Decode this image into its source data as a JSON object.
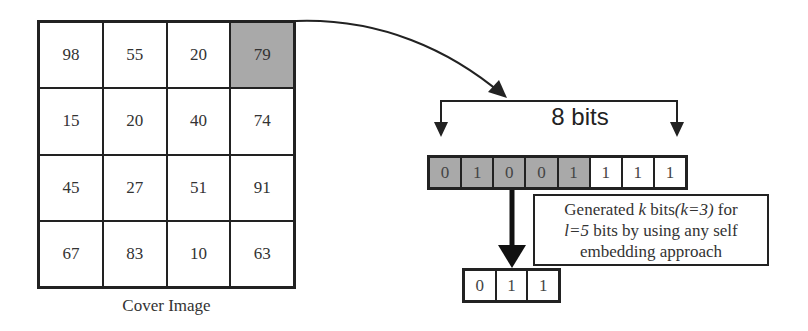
{
  "cover_image": {
    "caption": "Cover Image",
    "highlight_cell": {
      "row": 0,
      "col": 3
    },
    "rows": [
      [
        "98",
        "55",
        "20",
        "79"
      ],
      [
        "15",
        "20",
        "40",
        "74"
      ],
      [
        "45",
        "27",
        "51",
        "91"
      ],
      [
        "67",
        "83",
        "10",
        "63"
      ]
    ]
  },
  "bit_row": {
    "label": "8 bits",
    "bits": [
      "0",
      "1",
      "0",
      "0",
      "1",
      "1",
      "1",
      "1"
    ],
    "highlighted_count": 5
  },
  "note": {
    "line1_a": "Generated ",
    "line1_k": "k",
    "line1_b": " bits",
    "line1_eq": "(k=3)",
    "line1_c": " for",
    "line2_eq": "l=5",
    "line2_b": " bits by using any self",
    "line3": "embedding approach"
  },
  "output_bits": [
    "0",
    "1",
    "1"
  ],
  "colors": {
    "highlight": "#a9a9a9",
    "stroke": "#222222"
  }
}
